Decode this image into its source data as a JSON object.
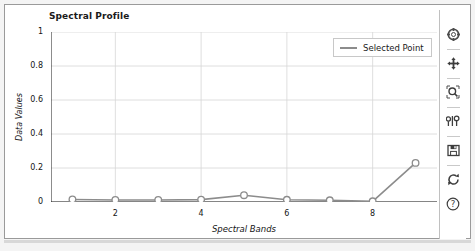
{
  "chart_data": {
    "type": "line",
    "title": "Spectral Profile",
    "xlabel": "Spectral Bands",
    "ylabel": "Data Values",
    "x": [
      1,
      2,
      3,
      4,
      5,
      6,
      7,
      8,
      9
    ],
    "xticklabels": [
      "2",
      "4",
      "6",
      "8"
    ],
    "xtickvalues": [
      2,
      4,
      6,
      8
    ],
    "yticklabels": [
      "0",
      "0.2",
      "0.4",
      "0.6",
      "0.8",
      "1"
    ],
    "ytickvalues": [
      0,
      0.2,
      0.4,
      0.6,
      0.8,
      1
    ],
    "xlim": [
      0.5,
      9.5
    ],
    "ylim": [
      0,
      1
    ],
    "grid": true,
    "minor_ticks": true,
    "legend_position": "upper right",
    "series": [
      {
        "name": "Selected Point",
        "color": "#8c8c8c",
        "marker": "circle-open",
        "values": [
          0.015,
          0.012,
          0.012,
          0.014,
          0.04,
          0.013,
          0.01,
          0.004,
          0.23
        ]
      }
    ]
  },
  "legend": {
    "entries": [
      {
        "label": "Selected Point"
      }
    ]
  },
  "toolbar": {
    "buttons": [
      {
        "name": "home-icon",
        "title": "Reset original view"
      },
      {
        "name": "pan-icon",
        "title": "Pan axes"
      },
      {
        "name": "zoom-icon",
        "title": "Zoom to rectangle"
      },
      {
        "name": "configure-subplots-icon",
        "title": "Configure subplots"
      },
      {
        "name": "save-icon",
        "title": "Save figure"
      },
      {
        "name": "refresh-icon",
        "title": "Refresh"
      },
      {
        "name": "help-icon",
        "title": "Help"
      }
    ]
  }
}
